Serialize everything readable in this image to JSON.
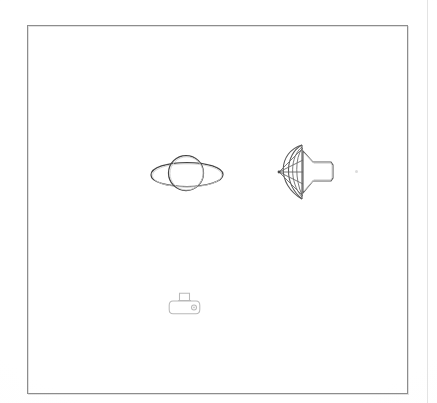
{
  "document": {
    "kind": "scanned-line-drawing",
    "background_color": "#ffffff",
    "ink_color": "#454545",
    "frame": {
      "name": "drawing-border",
      "stroke_color": "#8d8d8d",
      "x": 27,
      "y": 25,
      "width": 381,
      "height": 369
    },
    "page_edge_rule_color": "#e3e3e3"
  },
  "figures": [
    {
      "id": "ringed-planet",
      "label": "ringed planet",
      "description": "circle with a wide flat ellipse ring crossing it",
      "x": 145,
      "y": 148,
      "width": 84,
      "height": 52,
      "stroke_color": "#454545"
    },
    {
      "id": "parachute-payload",
      "label": "parachute with payload",
      "description": "fan shaped canopy of arcs with shroud lines converging left, attached to a flared nozzle body on the right",
      "x": 276,
      "y": 142,
      "width": 62,
      "height": 62,
      "stroke_color": "#5a5a5a",
      "shroud_line_count": 5,
      "canopy_gore_count": 4
    },
    {
      "id": "small-device",
      "label": "small device",
      "description": "rounded rectangle body with a raised tab on top and a small circle on the right face",
      "x": 168,
      "y": 291,
      "width": 34,
      "height": 26,
      "stroke_color": "#b9b9b9"
    },
    {
      "id": "faint-speck",
      "label": "faint speck",
      "description": "tiny light scanning artifact dot",
      "x": 355,
      "y": 170,
      "width": 4,
      "height": 4,
      "stroke_color": "#dcdcdc"
    }
  ]
}
